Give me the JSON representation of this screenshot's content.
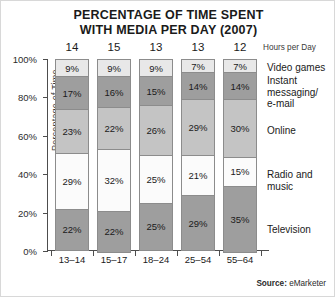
{
  "title": {
    "line1": "PERCENTAGE OF TIME SPENT",
    "line2": "WITH MEDIA PER DAY (2007)"
  },
  "hours_axis_label": "Hours per Day",
  "source": {
    "key": "Source:",
    "value": "eMarketer"
  },
  "chart_data": {
    "type": "bar",
    "subtype": "stacked-percent-column",
    "title": "PERCENTAGE OF TIME SPENT WITH MEDIA PER DAY (2007)",
    "xlabel": "",
    "ylabel": "Percentage of Time",
    "ylim": [
      0,
      100
    ],
    "yticks": [
      "0%",
      "20%",
      "40%",
      "60%",
      "80%",
      "100%"
    ],
    "ytick_values": [
      0,
      20,
      40,
      60,
      80,
      100
    ],
    "grid": false,
    "legend_position": "right",
    "categories": [
      "13–14",
      "15–17",
      "18–24",
      "25–54",
      "55–64"
    ],
    "hours_per_day": [
      14,
      15,
      13,
      13,
      12
    ],
    "series": [
      {
        "name": "Video games",
        "color": "#e8e8e8",
        "values": [
          9,
          9,
          9,
          7,
          7
        ],
        "labels": [
          "9%",
          "9%",
          "9%",
          "7%",
          "7%"
        ]
      },
      {
        "name": "Instant messaging/e-mail",
        "legend_lines": [
          "Instant",
          "messaging/",
          "e-mail"
        ],
        "color": "#9e9e9e",
        "values": [
          17,
          16,
          15,
          14,
          14
        ],
        "labels": [
          "17%",
          "16%",
          "15%",
          "14%",
          "14%"
        ]
      },
      {
        "name": "Online",
        "color": "#c4c4c4",
        "values": [
          23,
          22,
          26,
          29,
          30
        ],
        "labels": [
          "23%",
          "22%",
          "26%",
          "29%",
          "30%"
        ]
      },
      {
        "name": "Radio and music",
        "legend_lines": [
          "Radio and",
          "music"
        ],
        "color": "#fbfbfb",
        "values": [
          29,
          32,
          25,
          21,
          15
        ],
        "labels": [
          "29%",
          "32%",
          "25%",
          "21%",
          "15%"
        ]
      },
      {
        "name": "Television",
        "color": "#9e9e9e",
        "values": [
          22,
          22,
          25,
          29,
          35
        ],
        "labels": [
          "22%",
          "22%",
          "25%",
          "29%",
          "35%"
        ]
      }
    ]
  }
}
